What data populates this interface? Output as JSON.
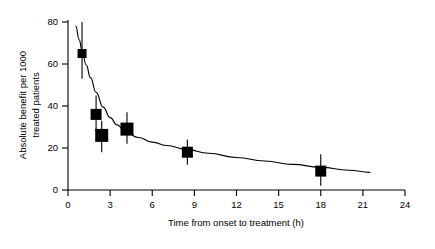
{
  "chart_data": {
    "type": "scatter",
    "title": "",
    "xlabel": "Time from onset to treatment (h)",
    "ylabel": "Absolute benefit per 1000 treated patients",
    "ylabel_lines": [
      "Absolute benefit per 1000",
      "treated patients"
    ],
    "xlim": [
      0,
      24
    ],
    "ylim": [
      0,
      80
    ],
    "xticks": [
      0,
      3,
      6,
      9,
      12,
      15,
      18,
      21,
      24
    ],
    "xtick_labels": [
      "0",
      "3",
      "6",
      "9",
      "12",
      "15",
      "18",
      "21",
      "24"
    ],
    "yticks": [
      0,
      20,
      40,
      60,
      80
    ],
    "ytick_labels": [
      "0",
      "20",
      "40",
      "60",
      "80"
    ],
    "grid": false,
    "legend": null,
    "marker_style": "filled-square",
    "errorbar_style": "vertical-95CI",
    "points": [
      {
        "x": 1.0,
        "y": 65,
        "y_low": 53,
        "y_high": 80,
        "marker_size": 9
      },
      {
        "x": 2.0,
        "y": 36,
        "y_low": 28,
        "y_high": 45,
        "marker_size": 11
      },
      {
        "x": 2.4,
        "y": 26,
        "y_low": 18,
        "y_high": 33,
        "marker_size": 13
      },
      {
        "x": 4.2,
        "y": 29,
        "y_low": 22,
        "y_high": 37,
        "marker_size": 13
      },
      {
        "x": 8.5,
        "y": 18,
        "y_low": 12,
        "y_high": 24,
        "marker_size": 11
      },
      {
        "x": 18.0,
        "y": 9,
        "y_low": 2,
        "y_high": 17,
        "marker_size": 11
      }
    ],
    "fit_curve": {
      "description": "fitted exponential-decay regression line",
      "x": [
        0.55,
        0.8,
        1.0,
        1.3,
        1.6,
        2.0,
        2.5,
        3.0,
        3.5,
        4.0,
        5.0,
        6.0,
        7.0,
        8.5,
        10.0,
        12.0,
        14.0,
        16.0,
        18.0,
        20.0,
        21.5
      ],
      "y": [
        78.0,
        71.5,
        66.5,
        59.5,
        53.5,
        46.5,
        39.5,
        34.5,
        31.0,
        28.5,
        25.0,
        22.8,
        21.2,
        19.2,
        17.5,
        15.5,
        13.8,
        12.2,
        10.8,
        9.4,
        8.4
      ]
    },
    "colors": {
      "axis": "#000000",
      "marker": "#000000",
      "curve": "#000000",
      "background": "#ffffff"
    }
  }
}
